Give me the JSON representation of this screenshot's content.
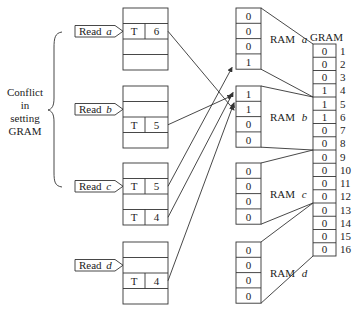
{
  "conflict_label": [
    "Conflict",
    "in",
    "setting",
    "GRAM"
  ],
  "reads": [
    {
      "id": "a",
      "label": "Read",
      "var": "a",
      "rows": [
        [
          "",
          ""
        ],
        [
          "T",
          "6"
        ],
        [
          "",
          ""
        ],
        [
          "",
          ""
        ]
      ],
      "pointer_row": 1
    },
    {
      "id": "b",
      "label": "Read",
      "var": "b",
      "rows": [
        [
          "",
          ""
        ],
        [
          "",
          ""
        ],
        [
          "T",
          "5"
        ],
        [
          "",
          ""
        ]
      ],
      "pointer_row": 1
    },
    {
      "id": "c",
      "label": "Read",
      "var": "c",
      "rows": [
        [
          "",
          ""
        ],
        [
          "T",
          "5"
        ],
        [
          "",
          ""
        ],
        [
          "T",
          "4"
        ]
      ],
      "pointer_row": 1
    },
    {
      "id": "d",
      "label": "Read",
      "var": "d",
      "rows": [
        [
          "",
          ""
        ],
        [
          "",
          ""
        ],
        [
          "T",
          "4"
        ],
        [
          "",
          ""
        ]
      ],
      "pointer_row": 1
    }
  ],
  "rams": [
    {
      "id": "a",
      "label": "RAM",
      "var": "a",
      "values": [
        "0",
        "0",
        "0",
        "1"
      ],
      "gram_range": [
        1,
        4
      ]
    },
    {
      "id": "b",
      "label": "RAM",
      "var": "b",
      "values": [
        "1",
        "1",
        "0",
        "0"
      ],
      "gram_range": [
        5,
        8
      ]
    },
    {
      "id": "c",
      "label": "RAM",
      "var": "c",
      "values": [
        "0",
        "0",
        "0",
        "0"
      ],
      "gram_range": [
        9,
        12
      ]
    },
    {
      "id": "d",
      "label": "RAM",
      "var": "d",
      "values": [
        "0",
        "0",
        "0",
        "0"
      ],
      "gram_range": [
        13,
        16
      ]
    }
  ],
  "gram": {
    "title": "GRAM",
    "values": [
      "0",
      "0",
      "0",
      "1",
      "1",
      "1",
      "0",
      "0",
      "0",
      "0",
      "0",
      "0",
      "0",
      "0",
      "0",
      "0"
    ],
    "indices": [
      "1",
      "2",
      "3",
      "4",
      "5",
      "6",
      "7",
      "8",
      "9",
      "10",
      "11",
      "12",
      "13",
      "14",
      "15",
      "16"
    ]
  },
  "arrows": [
    {
      "from": "read-a T6",
      "to": "ram-b row 2"
    },
    {
      "from": "read-b T5",
      "to": "ram-b row 1"
    },
    {
      "from": "read-c T5",
      "to": "ram-a row 4"
    },
    {
      "from": "read-c T4",
      "to": "ram-b row 1"
    },
    {
      "from": "read-d T4",
      "to": "ram-b row 2"
    }
  ]
}
